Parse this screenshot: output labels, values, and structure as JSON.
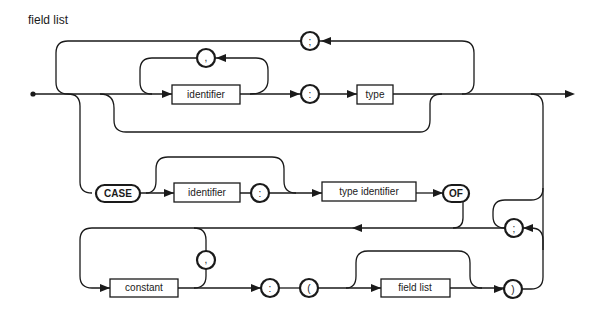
{
  "title": "field list",
  "diagram_type": "syntax-diagram",
  "nonterminals": {
    "identifier_1": "identifier",
    "type": "type",
    "identifier_2": "identifier",
    "type_identifier": "type identifier",
    "constant": "constant",
    "field_list": "field list"
  },
  "terminals": {
    "semicolon_top": ";",
    "comma_top": ",",
    "colon_1": ":",
    "case_kw": "CASE",
    "colon_2": ":",
    "of_kw": "OF",
    "semicolon_2": ";",
    "comma_2": ",",
    "colon_3": ":",
    "lparen": "(",
    "rparen": ")"
  }
}
